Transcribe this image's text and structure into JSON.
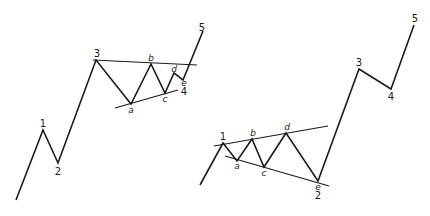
{
  "diagram": {
    "type": "elliott-wave-triangles",
    "panels": [
      {
        "name": "triangle-in-wave-4",
        "wave_points": [
          [
            16,
            200
          ],
          [
            43,
            130
          ],
          [
            58,
            163
          ],
          [
            96,
            60
          ],
          [
            131,
            104
          ],
          [
            151,
            64
          ],
          [
            165,
            93
          ],
          [
            174,
            73
          ],
          [
            183,
            80
          ],
          [
            203,
            31
          ]
        ],
        "trendlines": [
          [
            [
              93,
              60
            ],
            [
              197,
              65
            ]
          ],
          [
            [
              115,
              108
            ],
            [
              178,
              90
            ]
          ]
        ],
        "labels": [
          {
            "text": "1",
            "x": 43,
            "y": 127,
            "italic": false
          },
          {
            "text": "2",
            "x": 58,
            "y": 175,
            "italic": false
          },
          {
            "text": "3",
            "x": 97,
            "y": 57,
            "italic": false
          },
          {
            "text": "a",
            "x": 131,
            "y": 113,
            "italic": true
          },
          {
            "text": "b",
            "x": 151,
            "y": 61,
            "italic": true
          },
          {
            "text": "c",
            "x": 165,
            "y": 102,
            "italic": true
          },
          {
            "text": "d",
            "x": 174,
            "y": 72,
            "italic": true
          },
          {
            "text": "e",
            "x": 184,
            "y": 86,
            "italic": true
          },
          {
            "text": "4",
            "x": 184,
            "y": 95,
            "italic": false
          },
          {
            "text": "5",
            "x": 202,
            "y": 31,
            "italic": false
          }
        ]
      },
      {
        "name": "triangle-in-wave-2",
        "wave_points": [
          [
            200,
            185
          ],
          [
            223,
            143
          ],
          [
            237,
            161
          ],
          [
            252,
            139
          ],
          [
            264,
            167
          ],
          [
            286,
            133
          ],
          [
            318,
            181
          ],
          [
            359,
            69
          ],
          [
            391,
            89
          ],
          [
            414,
            25
          ]
        ],
        "trendlines": [
          [
            [
              214,
              146
            ],
            [
              328,
              126
            ]
          ],
          [
            [
              225,
              156
            ],
            [
              329,
              186
            ]
          ]
        ],
        "labels": [
          {
            "text": "1",
            "x": 223,
            "y": 140,
            "italic": false
          },
          {
            "text": "a",
            "x": 237,
            "y": 169,
            "italic": true
          },
          {
            "text": "b",
            "x": 253,
            "y": 136,
            "italic": true
          },
          {
            "text": "c",
            "x": 264,
            "y": 176,
            "italic": true
          },
          {
            "text": "d",
            "x": 287,
            "y": 130,
            "italic": true
          },
          {
            "text": "e",
            "x": 318,
            "y": 190,
            "italic": true
          },
          {
            "text": "2",
            "x": 318,
            "y": 199,
            "italic": false
          },
          {
            "text": "3",
            "x": 359,
            "y": 66,
            "italic": false
          },
          {
            "text": "4",
            "x": 391,
            "y": 100,
            "italic": false
          },
          {
            "text": "5",
            "x": 415,
            "y": 22,
            "italic": false
          }
        ]
      }
    ]
  }
}
